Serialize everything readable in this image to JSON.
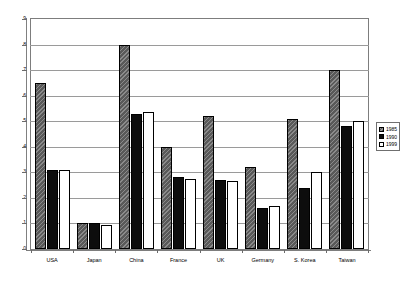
{
  "chart_data": {
    "type": "bar",
    "title": "",
    "xlabel": "",
    "ylabel": "",
    "ylim": [
      0,
      9
    ],
    "yticks": [
      0,
      1,
      2,
      3,
      4,
      5,
      6,
      7,
      8,
      9
    ],
    "ytick_labels": [
      "0",
      "1",
      "2",
      "3",
      "4",
      "5",
      "6",
      "7",
      "8",
      "9"
    ],
    "grid": true,
    "legend_position": "right",
    "categories": [
      "USA",
      "Japan",
      "China",
      "France",
      "UK",
      "Germany",
      "S. Korea",
      "Taiwan"
    ],
    "series": [
      {
        "name": "1985",
        "color": "#595959",
        "pattern": "hatched",
        "values": [
          6.5,
          1.0,
          8.0,
          4.0,
          5.2,
          3.2,
          5.1,
          7.0
        ]
      },
      {
        "name": "1990",
        "color": "#0d0d0d",
        "pattern": "solid",
        "values": [
          3.1,
          1.0,
          5.3,
          2.8,
          2.7,
          1.6,
          2.4,
          4.8
        ]
      },
      {
        "name": "1999",
        "color": "#ffffff",
        "pattern": "open",
        "values": [
          3.1,
          0.95,
          5.35,
          2.75,
          2.65,
          1.7,
          3.0,
          5.0
        ]
      }
    ]
  },
  "axis": {
    "y_ticks": [
      "0",
      "1",
      "2",
      "3",
      "4",
      "5",
      "6",
      "7",
      "8",
      "9"
    ]
  },
  "legend": {
    "items": [
      {
        "label": "1985"
      },
      {
        "label": "1990"
      },
      {
        "label": "1999"
      }
    ]
  }
}
